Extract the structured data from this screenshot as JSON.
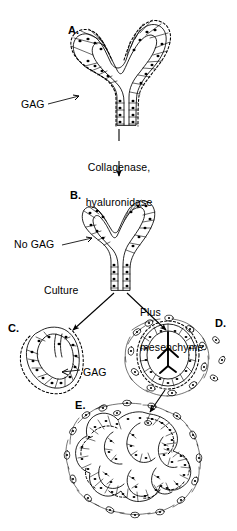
{
  "figure": {
    "background_color": "#ffffff",
    "ink_color": "#000000",
    "panels": [
      {
        "id": "A",
        "letter": "A.",
        "description": "Intact branched epithelial bud with columnar cells and continuous dashed basement-membrane glycosaminoglycan coat",
        "annotation": "GAG"
      },
      {
        "id": "B",
        "letter": "B.",
        "description": "Epithelial bud after enzyme treatment; basement membrane glycosaminoglycan removed, clefts shallower",
        "annotation": "No GAG"
      },
      {
        "id": "C",
        "letter": "C.",
        "description": "Epithelium cultured alone; single unbranched U-shaped lobe with regenerated glycosaminoglycan",
        "annotation": "GAG"
      },
      {
        "id": "D",
        "letter": "D.",
        "description": "Epithelium recombined with mesenchyme; rounded unbranched vesicle surrounded by mesenchymal cells",
        "annotation": ""
      },
      {
        "id": "E",
        "letter": "E.",
        "description": "Fully restored multilobular branched gland surrounded by mesenchyme",
        "annotation": ""
      }
    ],
    "labels": {
      "gag_top": "GAG",
      "no_gag": "No GAG",
      "gag_bottom": "GAG",
      "treatment_line1": "Collagenase,",
      "treatment_line2": "hyaluronidase",
      "culture": "Culture",
      "plus_mesenchyme_line1": "Plus",
      "plus_mesenchyme_line2": "mesenchyme"
    },
    "flow": [
      {
        "from": "A",
        "to": "B",
        "label": "Collagenase, hyaluronidase",
        "direction": "down"
      },
      {
        "from": "B",
        "to": "C",
        "label": "Culture",
        "direction": "down-left"
      },
      {
        "from": "B",
        "to": "D",
        "label": "Plus mesenchyme",
        "direction": "down-right"
      },
      {
        "from": "D",
        "to": "E",
        "label": "",
        "direction": "down-left"
      }
    ]
  }
}
